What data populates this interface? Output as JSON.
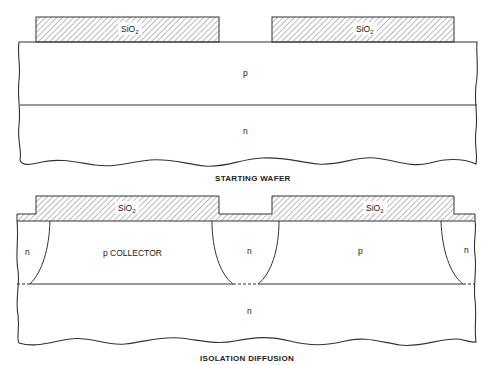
{
  "figure": {
    "panels": [
      {
        "caption": "STARTING WAFER",
        "oxide_label": "SiO",
        "oxide_subscript": "2",
        "layers": {
          "top": "p",
          "bottom": "n"
        }
      },
      {
        "caption": "ISOLATION DIFFUSION",
        "oxide_label": "SiO",
        "oxide_subscript": "2",
        "regions": {
          "left_isolation": "n",
          "collector": "p COLLECTOR",
          "middle_isolation": "n",
          "right_p": "p",
          "right_isolation": "n",
          "substrate": "n"
        }
      }
    ],
    "colors": {
      "line": "#333333",
      "hatch": "#555555",
      "background": "#ffffff"
    }
  }
}
